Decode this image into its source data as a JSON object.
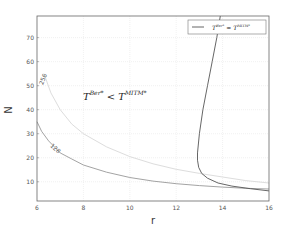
{
  "chart_data": {
    "type": "line",
    "title": "",
    "xlabel": "r",
    "ylabel": "N",
    "xlim": [
      6,
      16
    ],
    "ylim": [
      2,
      79
    ],
    "xticks": [
      6,
      8,
      10,
      12,
      14,
      16
    ],
    "yticks": [
      10,
      20,
      30,
      40,
      50,
      60,
      70
    ],
    "grid": true,
    "legend": {
      "position": "upper right",
      "entries": [
        "T^{Ber*} = T^{MITM*}"
      ]
    },
    "annotation": {
      "text_main": "T",
      "sup1": "Ber*",
      "relation": " < ",
      "text_second": "T",
      "sup2": "MITM*",
      "full": "T^{Ber*} < T^{MITM*}",
      "x": 8.0,
      "y": 47
    },
    "series": [
      {
        "name": "T^{Ber*} = T^{MITM*}",
        "color": "#555555",
        "points": [
          [
            13.9,
            79
          ],
          [
            13.75,
            70
          ],
          [
            13.55,
            60
          ],
          [
            13.35,
            50
          ],
          [
            13.15,
            40
          ],
          [
            13.0,
            30
          ],
          [
            12.92,
            22
          ],
          [
            12.92,
            19
          ],
          [
            12.97,
            16
          ],
          [
            13.1,
            13.5
          ],
          [
            13.35,
            11.5
          ],
          [
            13.8,
            9.5
          ],
          [
            14.4,
            8.2
          ],
          [
            15.2,
            7.1
          ],
          [
            16.0,
            6.2
          ]
        ]
      },
      {
        "name": "128",
        "color": "#999999",
        "contour_label": "128",
        "points": [
          [
            6.0,
            35
          ],
          [
            6.2,
            31
          ],
          [
            6.5,
            27
          ],
          [
            7.0,
            22
          ],
          [
            7.5,
            19.5
          ],
          [
            8.0,
            17
          ],
          [
            9.0,
            14
          ],
          [
            10.0,
            11.8
          ],
          [
            11.0,
            10.3
          ],
          [
            12.0,
            9.2
          ],
          [
            13.0,
            8.4
          ],
          [
            14.0,
            7.8
          ],
          [
            15.0,
            7.3
          ],
          [
            16.0,
            7.0
          ]
        ]
      },
      {
        "name": "256",
        "color": "#dddddd",
        "contour_label": "256",
        "points": [
          [
            6.3,
            55
          ],
          [
            6.6,
            47
          ],
          [
            7.0,
            40
          ],
          [
            7.5,
            34
          ],
          [
            8.0,
            30
          ],
          [
            9.0,
            24.5
          ],
          [
            10.0,
            20.5
          ],
          [
            11.0,
            17.5
          ],
          [
            12.0,
            15.2
          ],
          [
            13.0,
            13.5
          ],
          [
            14.0,
            12.0
          ],
          [
            15.0,
            10.5
          ],
          [
            16.0,
            9.5
          ]
        ]
      }
    ]
  }
}
